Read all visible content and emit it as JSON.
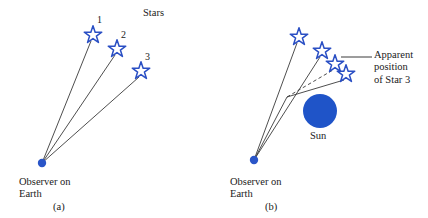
{
  "figure": {
    "width": 428,
    "height": 218,
    "background": "#ffffff",
    "colors": {
      "star_stroke": "#2a4fc4",
      "sun_fill": "#1f54c8",
      "observer_dot": "#2a55c8",
      "ray_line": "#3a3a3a",
      "text": "#1a1a1a",
      "leader_line": "#3a3a3a"
    }
  },
  "panel_a": {
    "caption": "(a)",
    "stars_title": "Stars",
    "observer_label": "Observer on\nEarth",
    "observer_point": {
      "x": 42,
      "y": 163
    },
    "star_numbers": [
      "1",
      "2",
      "3"
    ],
    "stars": [
      {
        "label": "1",
        "x": 93,
        "y": 35
      },
      {
        "label": "2",
        "x": 117,
        "y": 49
      },
      {
        "label": "3",
        "x": 141,
        "y": 71
      }
    ]
  },
  "panel_b": {
    "caption": "(b)",
    "observer_label": "Observer on\nEarth",
    "sun_label": "Sun",
    "apparent_label": "Apparent\nposition\nof Star 3",
    "observer_point": {
      "x": 254,
      "y": 160
    },
    "sun": {
      "x": 320,
      "y": 111,
      "r": 17
    },
    "stars": [
      {
        "label": "1",
        "x": 299,
        "y": 37,
        "kind": "real"
      },
      {
        "label": "2",
        "x": 322,
        "y": 51,
        "kind": "real"
      },
      {
        "label": "3-apparent",
        "x": 335,
        "y": 64,
        "kind": "apparent"
      },
      {
        "label": "3",
        "x": 346,
        "y": 74,
        "kind": "real"
      }
    ],
    "bend_point": {
      "x": 287,
      "y": 97
    },
    "leader_line": {
      "x1": 341,
      "y1": 57,
      "x2": 372,
      "y2": 57
    }
  }
}
